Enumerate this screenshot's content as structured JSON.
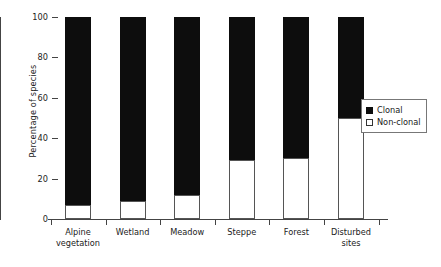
{
  "chart_data": {
    "type": "bar",
    "subtype": "stacked-100-percent",
    "title": "",
    "xlabel": "",
    "ylabel": "Percentage of species",
    "ylim": [
      0,
      100
    ],
    "yticks": [
      0,
      20,
      40,
      60,
      80,
      100
    ],
    "grid": false,
    "legend_position": "right",
    "categories": [
      "Alpine vegetation",
      "Wetland",
      "Meadow",
      "Steppe",
      "Forest",
      "Disturbed sites"
    ],
    "series": [
      {
        "name": "Clonal",
        "color": "#0d0d0d",
        "values": [
          93,
          91,
          88,
          71,
          70,
          50
        ]
      },
      {
        "name": "Non-clonal",
        "color": "#ffffff",
        "values": [
          7,
          9,
          12,
          29,
          30,
          50
        ]
      }
    ]
  },
  "axes": {
    "y": {
      "label": "Percentage of species",
      "ticks": [
        "0",
        "20",
        "40",
        "60",
        "80",
        "100"
      ]
    },
    "x": {
      "tick_labels": [
        {
          "line1": "Alpine",
          "line2": "vegetation"
        },
        {
          "line1": "Wetland",
          "line2": ""
        },
        {
          "line1": "Meadow",
          "line2": ""
        },
        {
          "line1": "Steppe",
          "line2": ""
        },
        {
          "line1": "Forest",
          "line2": ""
        },
        {
          "line1": "Disturbed",
          "line2": "sites"
        }
      ]
    }
  },
  "legend": {
    "entries": [
      {
        "label": "Clonal",
        "swatch": "filled-square"
      },
      {
        "label": "Non-clonal",
        "swatch": "hollow-square"
      }
    ]
  }
}
